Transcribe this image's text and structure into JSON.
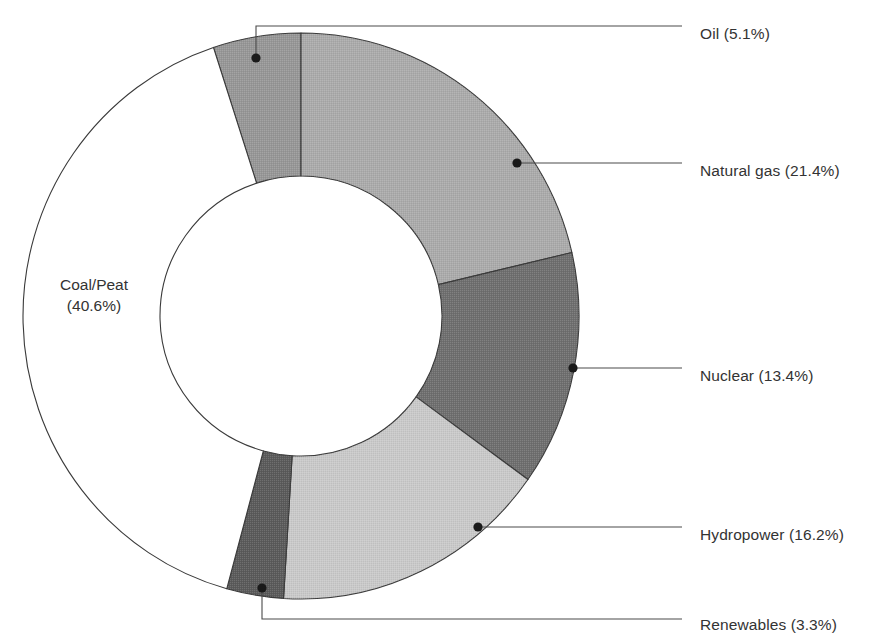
{
  "chart_data": {
    "type": "pie",
    "variant": "donut",
    "title": "",
    "subtitle": "",
    "xlabel": "",
    "ylabel": "",
    "legend_position": "callout-labels",
    "grid": false,
    "units": "percent",
    "total": 100.0,
    "categories": [
      "Oil",
      "Natural gas",
      "Nuclear",
      "Hydropower",
      "Renewables",
      "Coal/Peat"
    ],
    "values": [
      5.1,
      21.4,
      13.4,
      16.2,
      3.3,
      40.6
    ],
    "labels": [
      "Oil (5.1%)",
      "Natural gas (21.4%)",
      "Nuclear (13.4%)",
      "Hydropower (16.2%)",
      "Renewables (3.3%)",
      "Coal/Peat (40.6%)"
    ],
    "colors": [
      "#979797",
      "#ababab",
      "#6f6f6f",
      "#c9c9c9",
      "#5b5b5b",
      "#ffffff"
    ],
    "slices": [
      {
        "name": "Oil",
        "value": 5.1,
        "label": "Oil (5.1%)",
        "color": "#979797",
        "start_deg": -18.36,
        "end_deg": 0.0,
        "label_side": "right",
        "label_x": 700,
        "label_y": 35,
        "dot_x": 256,
        "dot_y": 58,
        "elbow_x": 256,
        "elbow_y": 26,
        "line_end_x": 682,
        "line_end_y": 26
      },
      {
        "name": "Natural gas",
        "value": 21.4,
        "label": "Natural gas (21.4%)",
        "color": "#ababab",
        "start_deg": 0.0,
        "end_deg": 77.04,
        "label_side": "right",
        "label_x": 700,
        "label_y": 172,
        "dot_x": 517,
        "dot_y": 163,
        "elbow_x": 517,
        "elbow_y": 163,
        "line_end_x": 682,
        "line_end_y": 163
      },
      {
        "name": "Nuclear",
        "value": 13.4,
        "label": "Nuclear (13.4%)",
        "color": "#6f6f6f",
        "start_deg": 77.04,
        "end_deg": 125.28,
        "label_side": "right",
        "label_x": 700,
        "label_y": 377,
        "dot_x": 573,
        "dot_y": 368,
        "elbow_x": 573,
        "elbow_y": 368,
        "line_end_x": 682,
        "line_end_y": 368
      },
      {
        "name": "Hydropower",
        "value": 16.2,
        "label": "Hydropower (16.2%)",
        "color": "#c9c9c9",
        "start_deg": 125.28,
        "end_deg": 183.6,
        "label_side": "right",
        "label_x": 700,
        "label_y": 536,
        "dot_x": 478,
        "dot_y": 527,
        "elbow_x": 478,
        "elbow_y": 527,
        "line_end_x": 682,
        "line_end_y": 527
      },
      {
        "name": "Renewables",
        "value": 3.3,
        "label": "Renewables (3.3%)",
        "color": "#5b5b5b",
        "start_deg": 183.6,
        "end_deg": 195.48,
        "label_side": "right",
        "label_x": 700,
        "label_y": 626,
        "dot_x": 262,
        "dot_y": 588,
        "elbow_x": 262,
        "elbow_y": 619,
        "line_end_x": 682,
        "line_end_y": 619
      },
      {
        "name": "Coal/Peat",
        "value": 40.6,
        "label": "Coal/Peat (40.6%)",
        "color": "#ffffff",
        "start_deg": 195.48,
        "end_deg": 341.64,
        "label_side": "inside",
        "label_line_1": "Coal/Peat",
        "label_line_2": "(40.6%)",
        "label_x": 94,
        "label_y": 290
      }
    ],
    "geometry": {
      "center_x": 301,
      "center_y": 316,
      "outer_rx": 278,
      "outer_ry": 283,
      "inner_rx": 141,
      "inner_ry": 140,
      "start_angle_deg": 0,
      "direction": "clockwise",
      "stroke_color": "#3a3a3a",
      "stroke_width": 1.1
    },
    "style": {
      "background": "#ffffff",
      "text_color": "#333333",
      "leader_line_color": "#4a4a4a",
      "leader_dot_color": "#1a1a1a",
      "font_size_px": 15.5
    }
  }
}
